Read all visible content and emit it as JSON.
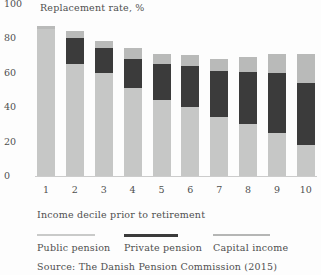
{
  "title": "Replacement rate, %",
  "x_axis_label": "Income decile prior to retirement",
  "source": "Source: The Danish Pension Commission (2015)",
  "colors": {
    "public_pension": "#c6c7c6",
    "private_pension": "#3b3b3b",
    "capital_income": "#b9bab9",
    "axis_line": "#cccccc",
    "text": "#4f4f4f",
    "background": "#fdfdfd"
  },
  "chart_data": {
    "type": "bar",
    "stacked": true,
    "title": "Replacement rate, %",
    "xlabel": "Income decile prior to retirement",
    "ylabel": "Replacement rate, %",
    "ylim": [
      0,
      100
    ],
    "yticks": [
      0,
      20,
      40,
      60,
      80,
      100
    ],
    "grid": false,
    "legend_position": "bottom",
    "categories": [
      "1",
      "2",
      "3",
      "4",
      "5",
      "6",
      "7",
      "8",
      "9",
      "10"
    ],
    "series": [
      {
        "name": "Public pension",
        "color": "#c6c7c6",
        "values": [
          85,
          65,
          60,
          51,
          44,
          40,
          34,
          30,
          25,
          18
        ]
      },
      {
        "name": "Private pension",
        "color": "#3b3b3b",
        "values": [
          0,
          15,
          14,
          17,
          21,
          24,
          27,
          30,
          35,
          36
        ]
      },
      {
        "name": "Capital income",
        "color": "#b9bab9",
        "values": [
          2,
          4,
          4,
          6,
          6,
          6,
          7,
          9,
          11,
          17
        ]
      }
    ],
    "totals": [
      87,
      84,
      78,
      74,
      71,
      70,
      68,
      69,
      71,
      71
    ]
  },
  "legend": {
    "items": [
      {
        "label": "Public pension",
        "color": "#c9cac9"
      },
      {
        "label": "Private pension",
        "color": "#3b3b3b"
      },
      {
        "label": "Capital income",
        "color": "#b5b6b5"
      }
    ]
  }
}
